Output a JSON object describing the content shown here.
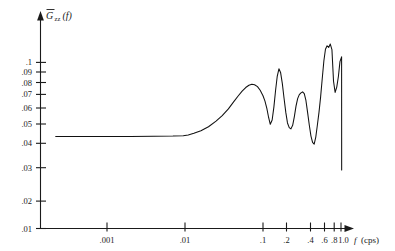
{
  "figure": {
    "name": "spectral-density-log-log-plot",
    "background_color": "#ffffff",
    "line_color": "#111111"
  },
  "yaxis": {
    "title_main": "G",
    "title_subscript": "zz",
    "title_arg": "(f)",
    "title_full": "Ḡzz(f)",
    "tick_labels": [
      ".1",
      ".09",
      ".08",
      ".07",
      ".06",
      ".05",
      ".04",
      ".03",
      ".02",
      ".01"
    ],
    "tick_values": [
      0.1,
      0.09,
      0.08,
      0.07,
      0.06,
      0.05,
      0.04,
      0.03,
      0.02,
      0.01
    ]
  },
  "xaxis": {
    "title": "f (cps)",
    "title_symbol": "f",
    "title_unit": "(cps)",
    "tick_labels": [
      ".001",
      ".01",
      ".1",
      ".2",
      ".4",
      ".6",
      ".8",
      "1.0"
    ],
    "tick_values": [
      0.001,
      0.01,
      0.1,
      0.2,
      0.4,
      0.6,
      0.8,
      1.0
    ]
  },
  "chart_data": {
    "type": "line",
    "title": "",
    "subtitle": "",
    "xlabel": "f (cps)",
    "ylabel": "Ḡzz(f)",
    "xscale": "log",
    "yscale": "log",
    "xlim": [
      0.0002,
      1.25
    ],
    "ylim": [
      0.01,
      0.135
    ],
    "grid": false,
    "legend": null,
    "xticks": [
      0.001,
      0.01,
      0.1,
      0.2,
      0.4,
      0.6,
      0.8,
      1.0
    ],
    "xticklabels": [
      ".001",
      ".01",
      ".1",
      ".2",
      ".4",
      ".6",
      ".8",
      "1.0"
    ],
    "yticks": [
      0.01,
      0.02,
      0.03,
      0.04,
      0.05,
      0.06,
      0.07,
      0.08,
      0.09,
      0.1
    ],
    "yticklabels": [
      ".01",
      ".02",
      ".03",
      ".04",
      ".05",
      ".06",
      ".07",
      ".08",
      ".09",
      ".1"
    ],
    "series": [
      {
        "name": "Gzz",
        "x": [
          0.00022,
          0.0005,
          0.001,
          0.002,
          0.004,
          0.007,
          0.0095,
          0.011,
          0.013,
          0.016,
          0.02,
          0.025,
          0.03,
          0.036,
          0.042,
          0.048,
          0.054,
          0.06,
          0.066,
          0.072,
          0.078,
          0.085,
          0.092,
          0.1,
          0.106,
          0.112,
          0.118,
          0.124,
          0.131,
          0.138,
          0.145,
          0.152,
          0.16,
          0.168,
          0.177,
          0.186,
          0.196,
          0.206,
          0.217,
          0.228,
          0.24,
          0.252,
          0.265,
          0.278,
          0.292,
          0.307,
          0.322,
          0.338,
          0.355,
          0.373,
          0.392,
          0.412,
          0.432,
          0.453,
          0.475,
          0.498,
          0.522,
          0.548,
          0.575,
          0.603,
          0.632,
          0.663,
          0.695,
          0.729,
          0.765,
          0.802,
          0.841,
          0.882,
          0.925,
          0.97,
          1.018,
          1.02
        ],
        "y": [
          0.0358,
          0.0358,
          0.0358,
          0.0358,
          0.0359,
          0.036,
          0.0362,
          0.0366,
          0.0374,
          0.0388,
          0.041,
          0.0443,
          0.0478,
          0.0525,
          0.0578,
          0.0628,
          0.0672,
          0.0706,
          0.0728,
          0.0738,
          0.0734,
          0.0715,
          0.068,
          0.063,
          0.0585,
          0.0528,
          0.0466,
          0.0424,
          0.045,
          0.054,
          0.068,
          0.082,
          0.0915,
          0.087,
          0.0745,
          0.061,
          0.05,
          0.0432,
          0.0405,
          0.0398,
          0.0418,
          0.047,
          0.0545,
          0.0605,
          0.064,
          0.0655,
          0.0665,
          0.0648,
          0.059,
          0.05,
          0.042,
          0.036,
          0.033,
          0.0322,
          0.0355,
          0.042,
          0.05,
          0.062,
          0.08,
          0.102,
          0.12,
          0.126,
          0.123,
          0.129,
          0.1195,
          0.077,
          0.066,
          0.071,
          0.082,
          0.101,
          0.108,
          0.0225
        ],
        "color": "#111111",
        "linewidth": 1.05
      }
    ],
    "annotations": [
      {
        "text": "flat low-frequency plateau at approximately 0.036",
        "x_range": [
          0.0002,
          0.011
        ]
      },
      {
        "text": "broad peak near f = 0.07 reaching approximately 0.074",
        "x_range": [
          0.054,
          0.085
        ]
      },
      {
        "text": "sharp narrow peak near f = 0.16 reaching approximately 0.092",
        "x_range": [
          0.145,
          0.177
        ]
      },
      {
        "text": "tall rapidly oscillating spikes above 0.12 between f = 0.6 and f = 1.0",
        "x_range": [
          0.6,
          1.02
        ]
      },
      {
        "text": "terminal vertical drop to approximately 0.022 at f = 1.0",
        "x_range": [
          1.018,
          1.02
        ]
      }
    ]
  }
}
